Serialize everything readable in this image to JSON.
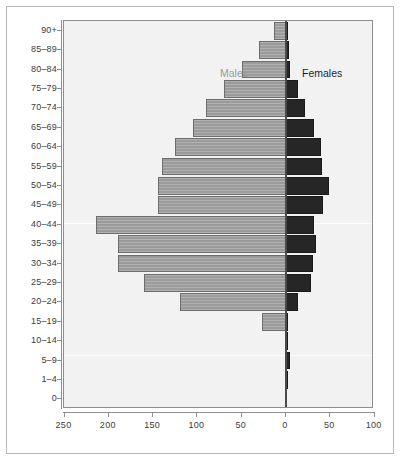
{
  "chart_data": {
    "type": "bar",
    "subtype": "population-pyramid",
    "title": "",
    "xlabel": "",
    "ylabel": "",
    "orientation": "horizontal",
    "grid": false,
    "legend_position": "inside-top",
    "categories": [
      "90+",
      "85–89",
      "80–84",
      "75–79",
      "70–74",
      "65–69",
      "60–64",
      "55–59",
      "50–54",
      "45–49",
      "40–44",
      "35–39",
      "30–34",
      "25–29",
      "20–24",
      "15–19",
      "10–14",
      "5–9",
      "1–4",
      "0"
    ],
    "series": [
      {
        "name": "Males",
        "side": "left",
        "color": "#9b9b9b",
        "values": [
          13,
          30,
          50,
          70,
          90,
          105,
          125,
          140,
          145,
          145,
          215,
          190,
          190,
          160,
          120,
          27,
          1,
          0,
          0,
          0
        ]
      },
      {
        "name": "Females",
        "side": "right",
        "color": "#262626",
        "values": [
          2,
          3,
          4,
          13,
          22,
          32,
          39,
          41,
          48,
          42,
          32,
          34,
          31,
          28,
          14,
          2,
          1,
          4,
          2,
          0
        ]
      }
    ],
    "x_ticks_left": [
      250,
      200,
      150,
      100,
      50
    ],
    "x_ticks_right": [
      0,
      50,
      100
    ],
    "x_tick_labels": [
      "250",
      "200",
      "150",
      "100",
      "50",
      "0",
      "50",
      "100"
    ],
    "xlim_left": 250,
    "xlim_right": 100
  },
  "legend": {
    "males": "Males",
    "females": "Females"
  },
  "colors": {
    "male_bar": "#9b9b9b",
    "female_bar": "#262626",
    "panel_background": "#f2f2f2",
    "axis": "#8e8e8e",
    "text": "#3b3b3b",
    "frame": "#b9b9b9"
  }
}
